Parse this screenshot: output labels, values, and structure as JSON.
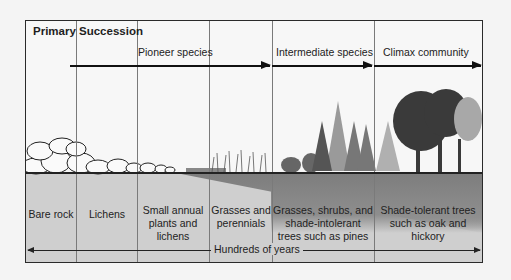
{
  "diagram": {
    "title": "Primary Succession",
    "stage_groups": [
      {
        "label": "Pioneer species"
      },
      {
        "label": "Intermediate species"
      },
      {
        "label": "Climax community"
      }
    ],
    "stages": [
      {
        "label": "Bare rock"
      },
      {
        "label": "Lichens"
      },
      {
        "label": "Small annual plants and lichens"
      },
      {
        "label": "Grasses and perennials"
      },
      {
        "label": "Grasses, shrubs, and shade-intolerant trees such as pines"
      },
      {
        "label": "Shade-tolerant trees such as oak and hickory"
      }
    ],
    "timeline_label": "Hundreds of years"
  }
}
